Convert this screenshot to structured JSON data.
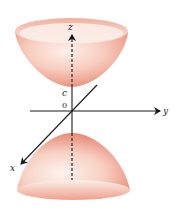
{
  "figure": {
    "type": "hyperboloid-of-two-sheets",
    "labels": {
      "z_axis": "z",
      "y_axis": "y",
      "x_axis": "x",
      "origin": "0",
      "vertex": "c"
    },
    "colors": {
      "surface_dark": "#e8806a",
      "surface_mid": "#f3b3a3",
      "surface_light": "#fdf0ec",
      "axis": "#1a1a1a",
      "background": "#ffffff"
    }
  }
}
